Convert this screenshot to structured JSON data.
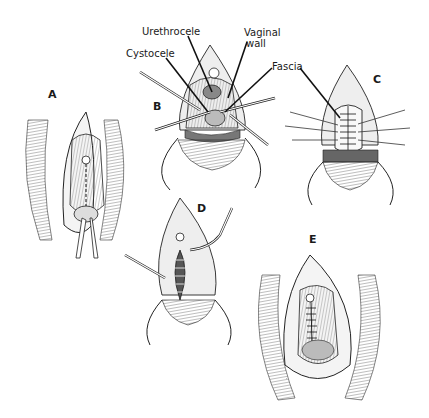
{
  "figure": {
    "panels": [
      {
        "id": "A",
        "label": "A"
      },
      {
        "id": "B",
        "label": "B"
      },
      {
        "id": "C",
        "label": "C"
      },
      {
        "id": "D",
        "label": "D"
      },
      {
        "id": "E",
        "label": "E"
      }
    ],
    "annotations": {
      "urethrocele": "Urethrocele",
      "vaginal_wall_line1": "Vaginal",
      "vaginal_wall_line2": "wall",
      "cystocele": "Cystocele",
      "fascia": "Fascia"
    },
    "colors": {
      "ink": "#1a1a1a",
      "background": "#ffffff",
      "shade": "#cfcfcf"
    }
  }
}
